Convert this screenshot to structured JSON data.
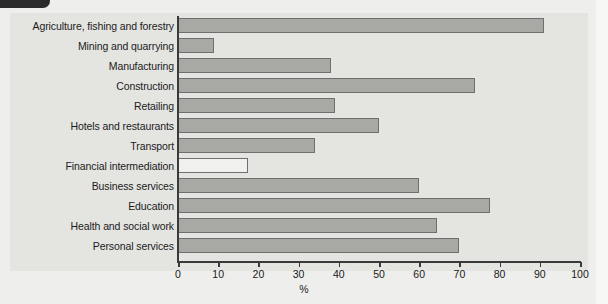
{
  "figure": {
    "corner_tab": "page-corner-tab"
  },
  "chart_data": {
    "type": "bar",
    "orientation": "horizontal",
    "title": "",
    "xlabel": "%",
    "ylabel": "",
    "xlim": [
      0,
      100
    ],
    "xticks": [
      0,
      10,
      20,
      30,
      40,
      50,
      60,
      70,
      80,
      90,
      100
    ],
    "grid": false,
    "legend": "none",
    "categories": [
      "Agriculture, fishing and forestry",
      "Mining and quarrying",
      "Manufacturing",
      "Construction",
      "Retailing",
      "Hotels and restaurants",
      "Transport",
      "Financial intermediation",
      "Business services",
      "Education",
      "Health and social work",
      "Personal services"
    ],
    "values": [
      91,
      9,
      38,
      74,
      39,
      50,
      34,
      17.5,
      60,
      77.5,
      64.5,
      70
    ],
    "bar_styles": [
      "filled",
      "filled",
      "filled",
      "filled",
      "filled",
      "filled",
      "filled",
      "unfilled",
      "filled",
      "filled",
      "filled",
      "filled"
    ],
    "colors": {
      "bar_fill": "#a8a8a5",
      "bar_unfilled": "#f0f0ee",
      "bar_edge": "#6f6f6f",
      "axis": "#3a3a3a",
      "panel_background": "#e4e4e1",
      "page_background": "#eeeeec",
      "text": "#1b1b1b"
    }
  }
}
